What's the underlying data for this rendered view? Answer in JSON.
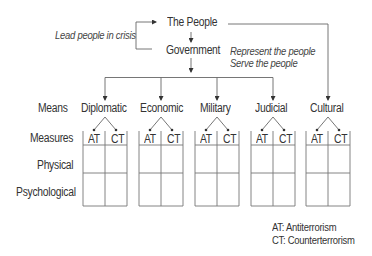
{
  "top": {
    "people": "The People",
    "government": "Government",
    "lead_note": "Lead people in crisis",
    "represent_note": "Represent the people",
    "serve_note": "Serve the people"
  },
  "rows": {
    "means": "Means",
    "measures": "Measures",
    "physical": "Physical",
    "psychological": "Psychological"
  },
  "means": [
    {
      "label": "Diplomatic",
      "cols": [
        "AT",
        "CT"
      ]
    },
    {
      "label": "Economic",
      "cols": [
        "AT",
        "CT"
      ]
    },
    {
      "label": "Military",
      "cols": [
        "AT",
        "CT"
      ]
    },
    {
      "label": "Judicial",
      "cols": [
        "AT",
        "CT"
      ]
    },
    {
      "label": "Cultural",
      "cols": [
        "AT",
        "CT"
      ]
    }
  ],
  "legend": {
    "at": "AT:  Antiterrorism",
    "ct": "CT:  Counterterrorism"
  },
  "colors": {
    "line": "#555555",
    "text": "#333333"
  }
}
